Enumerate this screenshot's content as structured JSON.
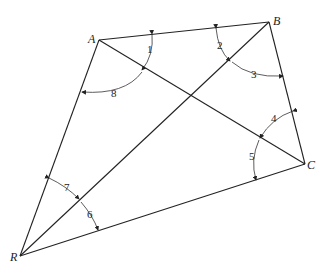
{
  "diagram": {
    "points": {
      "A": {
        "label": "A",
        "x": 99,
        "y": 40
      },
      "B": {
        "label": "B",
        "x": 269,
        "y": 22
      },
      "C": {
        "label": "C",
        "x": 305,
        "y": 164
      },
      "R": {
        "label": "R",
        "x": 20,
        "y": 256
      }
    },
    "segments": [
      "AB",
      "BC",
      "CR",
      "RA",
      "AC",
      "RB"
    ],
    "angles": [
      {
        "label": "1",
        "vertex": "A",
        "between": [
          "AB",
          "AC"
        ]
      },
      {
        "label": "2",
        "vertex": "B",
        "between": [
          "BA",
          "BR"
        ]
      },
      {
        "label": "3",
        "vertex": "B",
        "between": [
          "BR",
          "BC"
        ]
      },
      {
        "label": "4",
        "vertex": "C",
        "between": [
          "CB",
          "CA"
        ]
      },
      {
        "label": "5",
        "vertex": "C",
        "between": [
          "CA",
          "CR"
        ]
      },
      {
        "label": "6",
        "vertex": "R",
        "between": [
          "RB",
          "RC"
        ]
      },
      {
        "label": "7",
        "vertex": "R",
        "between": [
          "RA",
          "RB"
        ]
      },
      {
        "label": "8",
        "vertex": "A",
        "between": [
          "AC",
          "AR"
        ]
      }
    ]
  }
}
